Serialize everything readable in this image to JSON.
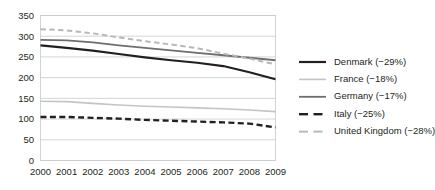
{
  "chart_data": {
    "type": "line",
    "title": "",
    "subtitle": "",
    "xlabel": "",
    "ylabel": "",
    "x": [
      2000,
      2001,
      2002,
      2003,
      2004,
      2005,
      2006,
      2007,
      2008,
      2009
    ],
    "categories": [
      "2000",
      "2001",
      "2002",
      "2003",
      "2004",
      "2005",
      "2006",
      "2007",
      "2008",
      "2009"
    ],
    "xlim": [
      2000,
      2009
    ],
    "ylim": [
      0,
      350
    ],
    "yticks": [
      0,
      50,
      100,
      150,
      200,
      250,
      300,
      350
    ],
    "ytick_labels": [
      "0",
      "50",
      "100",
      "150",
      "200",
      "250",
      "300",
      "350"
    ],
    "grid": "horizontal",
    "legend_position": "right",
    "series": [
      {
        "name": "Denmark (−29%)",
        "label": "Denmark (−29%)",
        "color": "#231f20",
        "style": "solid",
        "width": 2.2,
        "values": [
          278,
          272,
          265,
          257,
          249,
          242,
          236,
          228,
          213,
          196
        ]
      },
      {
        "name": "France (−18%)",
        "label": "France (−18%)",
        "color": "#c2c4c6",
        "style": "solid",
        "width": 1.6,
        "values": [
          143,
          142,
          138,
          134,
          131,
          129,
          127,
          125,
          122,
          118
        ]
      },
      {
        "name": "Germany (−17%)",
        "label": "Germany (−17%)",
        "color": "#6d6e70",
        "style": "solid",
        "width": 1.8,
        "values": [
          291,
          290,
          285,
          278,
          272,
          266,
          260,
          254,
          248,
          242
        ]
      },
      {
        "name": "Italy (−25%)",
        "label": "Italy (−25%)",
        "color": "#231f20",
        "style": "dashed",
        "width": 2.4,
        "values": [
          105,
          105,
          103,
          101,
          98,
          96,
          94,
          92,
          89,
          80
        ]
      },
      {
        "name": "United Kingdom (−28%)",
        "label": "United Kingdom (−28%)",
        "color": "#b6b8ba",
        "style": "dashed",
        "width": 2.0,
        "values": [
          317,
          314,
          307,
          297,
          288,
          280,
          271,
          258,
          246,
          232
        ]
      }
    ]
  },
  "axis": {
    "y_tick_labels": [
      "350",
      "300",
      "250",
      "200",
      "150",
      "100",
      "50",
      "0"
    ],
    "x_tick_labels": [
      "2000",
      "2001",
      "2002",
      "2003",
      "2004",
      "2005",
      "2006",
      "2007",
      "2008",
      "2009"
    ]
  },
  "legend": {
    "items": [
      {
        "label": "Denmark (−29%)",
        "icon": "line-swatch-solid-dark"
      },
      {
        "label": "France (−18%)",
        "icon": "line-swatch-solid-light"
      },
      {
        "label": "Germany (−17%)",
        "icon": "line-swatch-solid-gray"
      },
      {
        "label": "Italy (−25%)",
        "icon": "line-swatch-dashed-dark"
      },
      {
        "label": "United Kingdom (−28%)",
        "icon": "line-swatch-dashed-light"
      }
    ]
  },
  "colors": {
    "denmark": "#231f20",
    "france": "#c2c4c6",
    "germany": "#6d6e70",
    "italy": "#231f20",
    "united_kingdom": "#b6b8ba",
    "grid": "#c8c9ca",
    "text": "#231f20",
    "background": "#ffffff"
  }
}
